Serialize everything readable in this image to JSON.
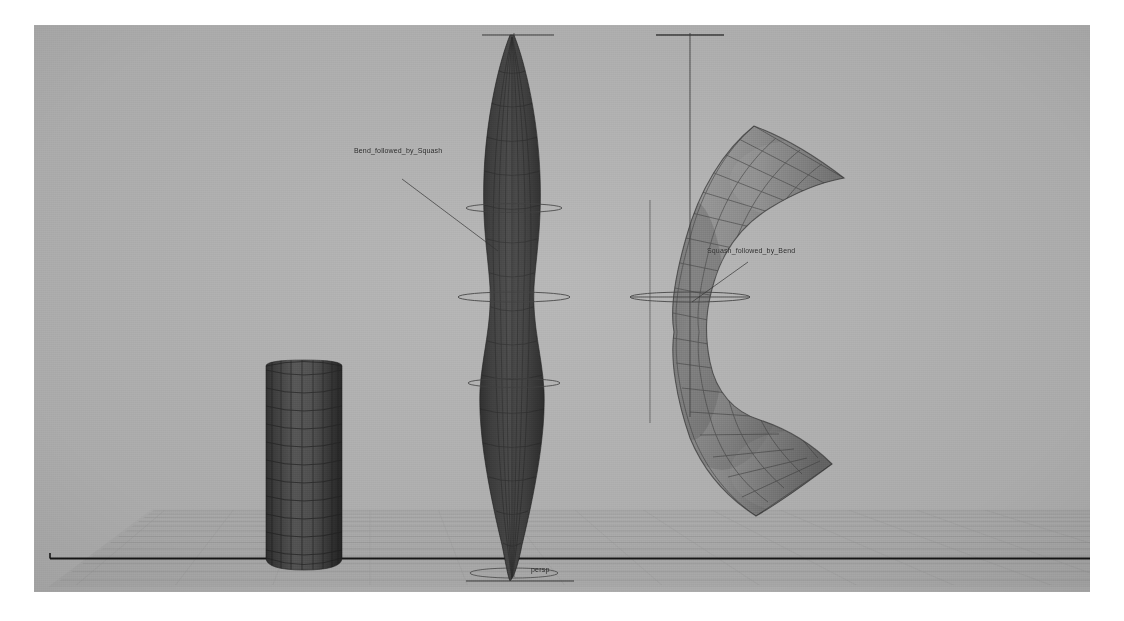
{
  "viewport": {
    "name_label": "persp",
    "background_color": "#b3b3b3",
    "ground_grid_color": "#9a9a9a",
    "axis_line_color": "#1a1a1a"
  },
  "annotations": [
    {
      "id": "bend-followed-by-squash",
      "text": "Bend_followed_by_Squash",
      "color": "#1c1c1c",
      "target_object": "middle-deformed-cylinder"
    },
    {
      "id": "squash-followed-by-bend",
      "text": "Squash_followed_by_Bend",
      "color": "#1c1c1c",
      "target_object": "right-bent-tube"
    }
  ],
  "objects": [
    {
      "id": "base-cylinder",
      "name": "Cylinder",
      "description": "undeformed wireframe-shaded cylinder",
      "shading": "dark",
      "fill_color": "#4a4a4a",
      "wireframe_color": "#2b2b2b"
    },
    {
      "id": "middle-deformed-cylinder",
      "name": "Bend_followed_by_Squash",
      "description": "tall tapered pointed shape, bend then squash deformation order",
      "shading": "dark",
      "fill_color": "#3c3c3c",
      "wireframe_color": "#262626"
    },
    {
      "id": "right-bent-tube",
      "name": "Squash_followed_by_Bend",
      "description": "C-shaped flared tube, squash then bend deformation order",
      "shading": "medium",
      "fill_color": "#8c8c8c",
      "wireframe_color": "#4e4e4e"
    }
  ],
  "deformer_handles": [
    {
      "id": "mid-handle",
      "type": "deformer-axis-with-rings",
      "object": "middle-deformed-cylinder",
      "color": "#3a3a3a"
    },
    {
      "id": "right-handle",
      "type": "deformer-axis-with-rings",
      "object": "right-bent-tube",
      "color": "#3a3a3a"
    }
  ]
}
